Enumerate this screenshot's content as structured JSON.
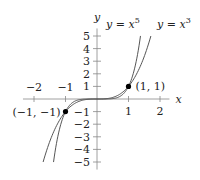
{
  "chart_data": {
    "type": "line",
    "title": "",
    "xlabel": "x",
    "ylabel": "y",
    "xlim": [
      -2.3,
      2.3
    ],
    "ylim": [
      -5.5,
      5.5
    ],
    "grid": false,
    "x_ticks": [
      -2,
      -1,
      1,
      2
    ],
    "x_tick_labels": [
      "−2",
      "−1",
      "1",
      "2"
    ],
    "y_ticks": [
      -5,
      -4,
      -3,
      -2,
      -1,
      1,
      2,
      3,
      4,
      5
    ],
    "y_tick_labels": [
      "−5",
      "−4",
      "−3",
      "−2",
      "−1",
      "1",
      "2",
      "3",
      "4",
      "5"
    ],
    "series": [
      {
        "name": "y = x^5",
        "label": "y = x",
        "exponent": "5",
        "function": "x^5",
        "domain": [
          -1.38,
          1.38
        ]
      },
      {
        "name": "y = x^3",
        "label": "y = x",
        "exponent": "3",
        "function": "x^3",
        "domain": [
          -1.71,
          1.71
        ]
      }
    ],
    "points": [
      {
        "x": 1,
        "y": 1,
        "label": "(1, 1)"
      },
      {
        "x": -1,
        "y": -1,
        "label": "(−1, −1)"
      }
    ],
    "colors": {
      "curve": "#555555",
      "axis": "#888888",
      "point": "#000000"
    }
  }
}
